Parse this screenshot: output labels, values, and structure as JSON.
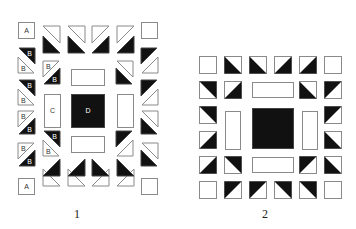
{
  "colors": {
    "dark": "#111111",
    "light": "#ffffff",
    "stroke": "#8a8a8a"
  },
  "diagrams": [
    {
      "id": "1",
      "caption": "1",
      "caption_pos": [
        74,
        207
      ],
      "pieces": [
        {
          "type": "rect",
          "x": 18,
          "y": 22,
          "w": 16,
          "h": 16,
          "fill": "light",
          "label": "A"
        },
        {
          "type": "rect",
          "x": 141,
          "y": 22,
          "w": 16,
          "h": 16,
          "fill": "light",
          "label": ""
        },
        {
          "type": "rect",
          "x": 18,
          "y": 178,
          "w": 16,
          "h": 16,
          "fill": "light",
          "label": "A"
        },
        {
          "type": "rect",
          "x": 141,
          "y": 178,
          "w": 16,
          "h": 16,
          "fill": "light",
          "label": ""
        },
        {
          "type": "tri",
          "pts": "43,26 60,26 60,43",
          "fill": "light",
          "label": ""
        },
        {
          "type": "tri",
          "pts": "43,36 43,53 60,53",
          "fill": "dark",
          "label": ""
        },
        {
          "type": "tri",
          "pts": "68,26 85,26 85,43",
          "fill": "light",
          "label": ""
        },
        {
          "type": "tri",
          "pts": "68,36 68,53 85,53",
          "fill": "dark",
          "label": ""
        },
        {
          "type": "tri",
          "pts": "92,26 109,26 92,43",
          "fill": "light",
          "label": ""
        },
        {
          "type": "tri",
          "pts": "109,36 109,53 92,53",
          "fill": "dark",
          "label": ""
        },
        {
          "type": "tri",
          "pts": "117,26 134,26 117,43",
          "fill": "light",
          "label": ""
        },
        {
          "type": "tri",
          "pts": "134,36 134,53 117,53",
          "fill": "dark",
          "label": ""
        },
        {
          "type": "tri",
          "pts": "43,186 60,186 43,169",
          "fill": "light",
          "label": ""
        },
        {
          "type": "tri",
          "pts": "43,176 60,176 60,159",
          "fill": "dark",
          "label": ""
        },
        {
          "type": "tri",
          "pts": "68,186 85,186 68,169",
          "fill": "light",
          "label": ""
        },
        {
          "type": "tri",
          "pts": "68,176 85,176 85,159",
          "fill": "dark",
          "label": ""
        },
        {
          "type": "tri",
          "pts": "92,186 109,186 109,169",
          "fill": "light",
          "label": ""
        },
        {
          "type": "tri",
          "pts": "92,176 109,176 92,159",
          "fill": "dark",
          "label": ""
        },
        {
          "type": "tri",
          "pts": "117,186 134,186 134,169",
          "fill": "light",
          "label": ""
        },
        {
          "type": "tri",
          "pts": "117,176 134,176 117,159",
          "fill": "dark",
          "label": ""
        },
        {
          "type": "tri",
          "pts": "19,48 35,48 35,64",
          "fill": "dark",
          "label": "B"
        },
        {
          "type": "tri",
          "pts": "18,57 18,73 34,73",
          "fill": "light",
          "label": "B"
        },
        {
          "type": "tri",
          "pts": "19,80 35,80 35,96",
          "fill": "dark",
          "label": "B"
        },
        {
          "type": "tri",
          "pts": "18,89 18,105 34,105",
          "fill": "light",
          "label": "B"
        },
        {
          "type": "tri",
          "pts": "18,111 34,111 18,127",
          "fill": "light",
          "label": "B"
        },
        {
          "type": "tri",
          "pts": "35,118 35,134 19,134",
          "fill": "dark",
          "label": "B"
        },
        {
          "type": "tri",
          "pts": "18,143 34,143 18,159",
          "fill": "light",
          "label": "B"
        },
        {
          "type": "tri",
          "pts": "35,150 35,166 19,166",
          "fill": "dark",
          "label": "B"
        },
        {
          "type": "tri",
          "pts": "43,61 59,61 43,77",
          "fill": "light",
          "label": "B"
        },
        {
          "type": "tri",
          "pts": "60,68 60,84 44,84",
          "fill": "dark",
          "label": "B"
        },
        {
          "type": "tri",
          "pts": "44,131 60,131 60,147",
          "fill": "dark",
          "label": "B"
        },
        {
          "type": "tri",
          "pts": "43,140 43,156 59,156",
          "fill": "light",
          "label": "B"
        },
        {
          "type": "tri",
          "pts": "117,61 133,61 133,77",
          "fill": "light",
          "label": ""
        },
        {
          "type": "tri",
          "pts": "116,68 116,84 132,84",
          "fill": "dark",
          "label": ""
        },
        {
          "type": "tri",
          "pts": "116,131 132,131 116,147",
          "fill": "dark",
          "label": ""
        },
        {
          "type": "tri",
          "pts": "133,140 133,156 117,156",
          "fill": "light",
          "label": ""
        },
        {
          "type": "tri",
          "pts": "141,48 157,48 141,64",
          "fill": "dark",
          "label": ""
        },
        {
          "type": "tri",
          "pts": "158,57 158,73 142,73",
          "fill": "light",
          "label": ""
        },
        {
          "type": "tri",
          "pts": "141,80 157,80 141,96",
          "fill": "dark",
          "label": ""
        },
        {
          "type": "tri",
          "pts": "158,89 158,105 142,105",
          "fill": "light",
          "label": ""
        },
        {
          "type": "tri",
          "pts": "142,111 158,111 158,127",
          "fill": "light",
          "label": ""
        },
        {
          "type": "tri",
          "pts": "141,118 141,134 157,134",
          "fill": "dark",
          "label": ""
        },
        {
          "type": "tri",
          "pts": "142,143 158,143 158,159",
          "fill": "light",
          "label": ""
        },
        {
          "type": "tri",
          "pts": "141,150 141,166 157,166",
          "fill": "dark",
          "label": ""
        },
        {
          "type": "rect",
          "x": 71,
          "y": 69,
          "w": 33,
          "h": 16,
          "fill": "light",
          "label": ""
        },
        {
          "type": "rect",
          "x": 71,
          "y": 136,
          "w": 33,
          "h": 16,
          "fill": "light",
          "label": ""
        },
        {
          "type": "rect",
          "x": 44,
          "y": 94,
          "w": 16,
          "h": 33,
          "fill": "light",
          "label": "C"
        },
        {
          "type": "rect",
          "x": 117,
          "y": 94,
          "w": 16,
          "h": 33,
          "fill": "light",
          "label": ""
        },
        {
          "type": "rect",
          "x": 71,
          "y": 94,
          "w": 33,
          "h": 33,
          "fill": "dark",
          "label": "D"
        }
      ]
    },
    {
      "id": "2",
      "caption": "2",
      "caption_pos": [
        262,
        207
      ],
      "pieces": [
        {
          "type": "rect",
          "x": 199,
          "y": 56,
          "w": 17,
          "h": 17,
          "fill": "light",
          "label": ""
        },
        {
          "type": "rect",
          "x": 324,
          "y": 56,
          "w": 17,
          "h": 17,
          "fill": "light",
          "label": ""
        },
        {
          "type": "rect",
          "x": 199,
          "y": 181,
          "w": 17,
          "h": 17,
          "fill": "light",
          "label": ""
        },
        {
          "type": "rect",
          "x": 324,
          "y": 181,
          "w": 17,
          "h": 17,
          "fill": "light",
          "label": ""
        },
        {
          "type": "hst",
          "x": 224,
          "y": 56,
          "s": 17,
          "dark": "bl"
        },
        {
          "type": "hst",
          "x": 249,
          "y": 56,
          "s": 17,
          "dark": "bl"
        },
        {
          "type": "hst",
          "x": 274,
          "y": 56,
          "s": 17,
          "dark": "br"
        },
        {
          "type": "hst",
          "x": 299,
          "y": 56,
          "s": 17,
          "dark": "br"
        },
        {
          "type": "hst",
          "x": 224,
          "y": 181,
          "s": 17,
          "dark": "tl"
        },
        {
          "type": "hst",
          "x": 249,
          "y": 181,
          "s": 17,
          "dark": "tl"
        },
        {
          "type": "hst",
          "x": 274,
          "y": 181,
          "s": 17,
          "dark": "tr"
        },
        {
          "type": "hst",
          "x": 299,
          "y": 181,
          "s": 17,
          "dark": "tr"
        },
        {
          "type": "hst",
          "x": 199,
          "y": 81,
          "s": 17,
          "dark": "tr"
        },
        {
          "type": "hst",
          "x": 199,
          "y": 106,
          "s": 17,
          "dark": "tr"
        },
        {
          "type": "hst",
          "x": 199,
          "y": 131,
          "s": 17,
          "dark": "br"
        },
        {
          "type": "hst",
          "x": 199,
          "y": 156,
          "s": 17,
          "dark": "br"
        },
        {
          "type": "hst",
          "x": 324,
          "y": 81,
          "s": 17,
          "dark": "tl"
        },
        {
          "type": "hst",
          "x": 324,
          "y": 106,
          "s": 17,
          "dark": "tl"
        },
        {
          "type": "hst",
          "x": 324,
          "y": 131,
          "s": 17,
          "dark": "bl"
        },
        {
          "type": "hst",
          "x": 324,
          "y": 156,
          "s": 17,
          "dark": "bl"
        },
        {
          "type": "hst",
          "x": 224,
          "y": 81,
          "s": 17,
          "dark": "br"
        },
        {
          "type": "hst",
          "x": 299,
          "y": 81,
          "s": 17,
          "dark": "bl"
        },
        {
          "type": "hst",
          "x": 224,
          "y": 156,
          "s": 17,
          "dark": "tr"
        },
        {
          "type": "hst",
          "x": 299,
          "y": 156,
          "s": 17,
          "dark": "tl"
        },
        {
          "type": "rect",
          "x": 252,
          "y": 82,
          "w": 41,
          "h": 15,
          "fill": "light",
          "label": ""
        },
        {
          "type": "rect",
          "x": 252,
          "y": 157,
          "w": 41,
          "h": 15,
          "fill": "light",
          "label": ""
        },
        {
          "type": "rect",
          "x": 225,
          "y": 111,
          "w": 15,
          "h": 38,
          "fill": "light",
          "label": ""
        },
        {
          "type": "rect",
          "x": 302,
          "y": 111,
          "w": 15,
          "h": 38,
          "fill": "light",
          "label": ""
        },
        {
          "type": "rect",
          "x": 252,
          "y": 108,
          "w": 41,
          "h": 40,
          "fill": "dark",
          "label": ""
        }
      ]
    }
  ]
}
